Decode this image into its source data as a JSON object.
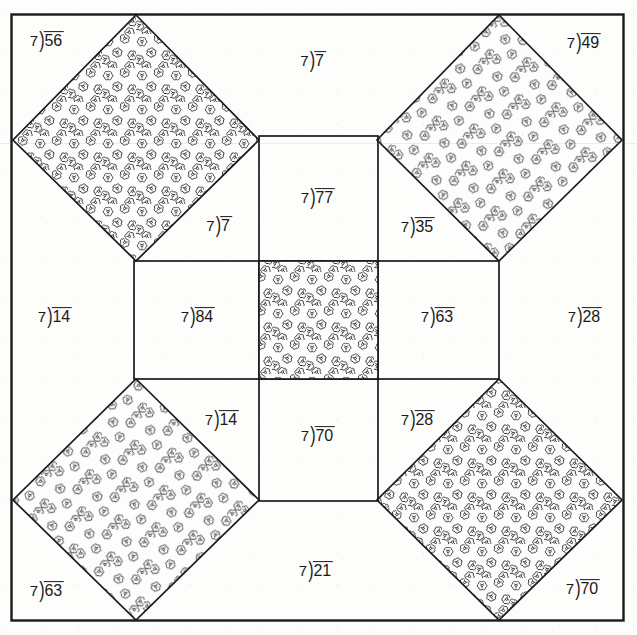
{
  "sheet": {
    "title": "Division Quilt Pattern Worksheet",
    "divisor": "7",
    "bracket_glyph": ")",
    "ink_color": "#1a1a1a",
    "paper_color": "#fdfdfc",
    "pattern_fill_label": "floral-texture",
    "width": 637,
    "height": 635
  },
  "problems": {
    "top_left_corner": {
      "divisor": "7",
      "dividend": "56",
      "region": "top-left-square-corner",
      "x": 47,
      "y": 40,
      "shaded": false
    },
    "top_center": {
      "divisor": "7",
      "dividend": "7",
      "region": "top-center-strip",
      "x": 313,
      "y": 60,
      "shaded": false
    },
    "top_right_corner": {
      "divisor": "7",
      "dividend": "49",
      "region": "top-right-square-corner",
      "x": 584,
      "y": 42,
      "shaded": false
    },
    "upper_center_cell": {
      "divisor": "7",
      "dividend": "77",
      "region": "center-top-cell",
      "x": 318,
      "y": 197,
      "shaded": false
    },
    "upper_left_inner": {
      "divisor": "7",
      "dividend": "7",
      "region": "upper-left-inner-notch",
      "x": 219,
      "y": 225,
      "shaded": false
    },
    "upper_right_inner": {
      "divisor": "7",
      "dividend": "35",
      "region": "upper-right-inner-notch",
      "x": 418,
      "y": 226,
      "shaded": false
    },
    "left_outer": {
      "divisor": "7",
      "dividend": "14",
      "region": "left-outer-strip",
      "x": 55,
      "y": 316,
      "shaded": false
    },
    "middle_left_cell": {
      "divisor": "7",
      "dividend": "84",
      "region": "center-left-cell",
      "x": 198,
      "y": 316,
      "shaded": false
    },
    "middle_right_cell": {
      "divisor": "7",
      "dividend": "63",
      "region": "center-right-cell",
      "x": 438,
      "y": 316,
      "shaded": false
    },
    "right_outer": {
      "divisor": "7",
      "dividend": "28",
      "region": "right-outer-strip",
      "x": 585,
      "y": 316,
      "shaded": false
    },
    "center_cell": {
      "divisor": "",
      "dividend": "",
      "region": "center-cell-shaded",
      "x": 318,
      "y": 316,
      "shaded": true
    },
    "lower_left_inner": {
      "divisor": "7",
      "dividend": "14",
      "region": "lower-left-inner-notch",
      "x": 222,
      "y": 419,
      "shaded": false
    },
    "lower_center_cell": {
      "divisor": "7",
      "dividend": "70",
      "region": "center-bottom-cell",
      "x": 318,
      "y": 435,
      "shaded": false
    },
    "lower_right_inner": {
      "divisor": "7",
      "dividend": "28",
      "region": "lower-right-inner-notch",
      "x": 418,
      "y": 419,
      "shaded": false
    },
    "bottom_left_corner": {
      "divisor": "7",
      "dividend": "63",
      "region": "bottom-left-square-corner",
      "x": 47,
      "y": 590,
      "shaded": false
    },
    "bottom_center": {
      "divisor": "7",
      "dividend": "21",
      "region": "bottom-center-strip",
      "x": 316,
      "y": 570,
      "shaded": false
    },
    "bottom_right_corner": {
      "divisor": "7",
      "dividend": "70",
      "region": "bottom-right-square-corner",
      "x": 583,
      "y": 588,
      "shaded": false
    }
  },
  "shaded_regions": [
    {
      "name": "top-left-diamond",
      "label": "floral-texture"
    },
    {
      "name": "top-right-diamond",
      "label": "floral-texture"
    },
    {
      "name": "bottom-left-diamond",
      "label": "floral-texture"
    },
    {
      "name": "bottom-right-diamond",
      "label": "floral-texture"
    },
    {
      "name": "center-square",
      "label": "floral-texture"
    }
  ]
}
